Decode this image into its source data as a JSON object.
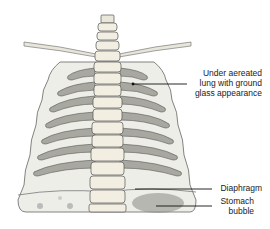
{
  "figure": {
    "labels": [
      {
        "id": "lung",
        "lines": [
          "Under aereated",
          "lung with ground",
          "glass appearance"
        ]
      },
      {
        "id": "diaphragm",
        "lines": [
          "Diaphragm"
        ]
      },
      {
        "id": "stomach",
        "lines": [
          "Stomach",
          "bubble"
        ]
      }
    ]
  },
  "colors": {
    "bone": "#f0ede0",
    "rib_shadow": "#9a9a90",
    "outline": "#555555",
    "lung": "#e8e8e2",
    "stomach": "#6a6a66"
  }
}
